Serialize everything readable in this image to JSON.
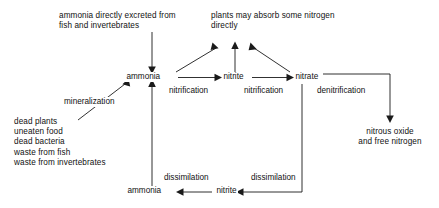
{
  "diagram": {
    "background_color": "#ffffff",
    "line_color": "#1a1a1a",
    "text_color": "#111111",
    "nodes": {
      "ammonia_center": "ammonia",
      "nitrite_center": "nitrite",
      "nitrate_center": "nitrate",
      "ammonia_bottom": "ammonia",
      "nitrite_bottom": "nitrite"
    },
    "captions": {
      "excreted_line1": "ammonia directly excreted from",
      "excreted_line2": "fish and invertebrates",
      "plants_line1": "plants may absorb some nitrogen",
      "plants_line2": "directly",
      "nitrous_line1": "nitrous oxide",
      "nitrous_line2": "and free nitrogen"
    },
    "sources": {
      "item1": "dead plants",
      "item2": "uneaten food",
      "item3": "dead bacteria",
      "item4": "waste from fish",
      "item5": "waste from invertebrates"
    },
    "edge_labels": {
      "mineralization": "mineralization",
      "nitrification_1": "nitrification",
      "nitrification_2": "nitrification",
      "denitrification": "denitrification",
      "dissimilation_1": "dissimilation",
      "dissimilation_2": "dissimilation"
    }
  }
}
